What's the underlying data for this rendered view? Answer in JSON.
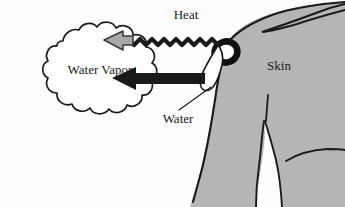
{
  "figure": {
    "background_color": "#fdfdfd",
    "line_color": "#1a1a1a",
    "skin_fill_color": "#b5b5b5",
    "vapor_fill_color": "#ffffff",
    "heat_arrow_color": "#a8a8a8",
    "water_arrow_color": "#1a1a1a"
  },
  "labels": {
    "heat": "Heat",
    "water_vapor": "Water Vapor",
    "skin": "Skin",
    "water": "Water"
  },
  "elements": {
    "heat_arrow_name": "heat-wavy-arrow",
    "water_arrow_name": "water-arrow",
    "vapor_cloud_name": "water-vapor-cloud",
    "droplet_name": "water-droplet",
    "pore_name": "skin-pore",
    "body_name": "body-silhouette",
    "leader_line_name": "water-leader-line"
  }
}
